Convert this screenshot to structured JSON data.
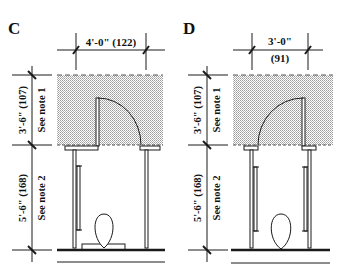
{
  "figures": [
    {
      "label": "C",
      "width_dim": "4'-0\" (122)",
      "depth_upper_dim": "3'-6\" (107)",
      "depth_upper_note": "See note 1",
      "depth_lower_dim": "5'-6\" (168)",
      "depth_lower_note": "See note 2"
    },
    {
      "label": "D",
      "width_dim_line1": "3'-0\"",
      "width_dim_line2": "(91)",
      "depth_upper_dim": "3'-6\" (107)",
      "depth_upper_note": "See note 1",
      "depth_lower_dim": "5'-6\" (168)",
      "depth_lower_note": "See note 2"
    }
  ],
  "colors": {
    "line": "#1a1a1a",
    "shading": "#c8c8c8"
  }
}
